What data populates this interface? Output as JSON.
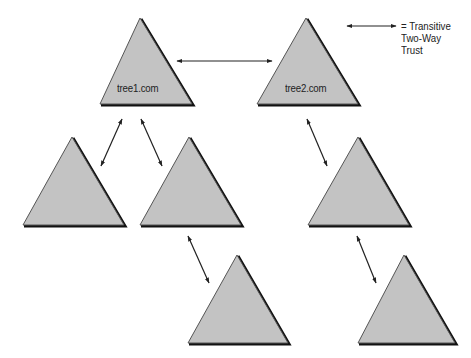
{
  "diagram": {
    "type": "domain-forest-trust",
    "colors": {
      "background": "#ffffff",
      "triangle_fill": "#c3c3c3",
      "triangle_edge": "#555555",
      "triangle_shadow": "#111111",
      "arrow": "#222222",
      "text": "#222222"
    },
    "triangles": [
      {
        "id": "tree1",
        "label": "tree1.com",
        "apex": [
          140,
          18
        ],
        "left": [
          100,
          104
        ],
        "right": [
          192,
          104
        ],
        "label_pos": [
          117,
          82
        ]
      },
      {
        "id": "tree2",
        "label": "tree2.com",
        "apex": [
          306,
          18
        ],
        "left": [
          257,
          104
        ],
        "right": [
          358,
          104
        ],
        "label_pos": [
          285,
          82
        ]
      },
      {
        "id": "child-a",
        "label": "",
        "apex": [
          72,
          137
        ],
        "left": [
          23,
          225
        ],
        "right": [
          124,
          225
        ]
      },
      {
        "id": "child-b",
        "label": "",
        "apex": [
          189,
          137
        ],
        "left": [
          140,
          225
        ],
        "right": [
          241,
          225
        ]
      },
      {
        "id": "child-c",
        "label": "",
        "apex": [
          358,
          137
        ],
        "left": [
          308,
          225
        ],
        "right": [
          409,
          225
        ]
      },
      {
        "id": "grandchild-b",
        "label": "",
        "apex": [
          237,
          255
        ],
        "left": [
          188,
          343
        ],
        "right": [
          288,
          343
        ]
      },
      {
        "id": "grandchild-c",
        "label": "",
        "apex": [
          404,
          255
        ],
        "left": [
          358,
          343
        ],
        "right": [
          455,
          343
        ]
      }
    ],
    "arrows": [
      {
        "from": "tree1",
        "to": "tree2",
        "x1": 177,
        "y1": 61,
        "x2": 272,
        "y2": 61
      },
      {
        "from": "tree1",
        "to": "child-a",
        "x1": 122,
        "y1": 119,
        "x2": 101,
        "y2": 166
      },
      {
        "from": "tree1",
        "to": "child-b",
        "x1": 141,
        "y1": 119,
        "x2": 162,
        "y2": 166
      },
      {
        "from": "tree2",
        "to": "child-c",
        "x1": 307,
        "y1": 119,
        "x2": 327,
        "y2": 166
      },
      {
        "from": "child-b",
        "to": "grandchild-b",
        "x1": 188,
        "y1": 236,
        "x2": 209,
        "y2": 283
      },
      {
        "from": "child-c",
        "to": "grandchild-c",
        "x1": 357,
        "y1": 236,
        "x2": 376,
        "y2": 283
      }
    ],
    "legend": {
      "arrow": {
        "x1": 347,
        "y1": 26,
        "x2": 396,
        "y2": 26
      },
      "lines": [
        "= Transitive",
        "Two-Way",
        "Trust"
      ],
      "text_pos": [
        401,
        20
      ]
    }
  }
}
